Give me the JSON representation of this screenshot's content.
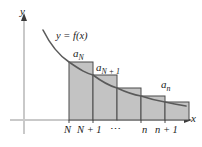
{
  "figure": {
    "colors": {
      "bar_fill": "#c3c3c3",
      "bar_stroke": "#4a4a4a",
      "curve": "#5a5a5a",
      "axis": "#c9c9c9",
      "text": "#1a1a1a",
      "background": "#ffffff"
    },
    "axes": {
      "y_label": "y",
      "x_label": "x",
      "origin": {
        "x": 24,
        "y": 120
      },
      "x_end": 196,
      "y_top": 14
    },
    "curve": {
      "label": "y = f(x)",
      "label_parts": {
        "y": "y",
        "equals": "=",
        "f": "f",
        "open": "(",
        "x": "x",
        "close": ")"
      }
    },
    "bars": [
      {
        "name": "a_N",
        "label": "a",
        "subscript": "N",
        "x": 69,
        "width": 24,
        "top": 62,
        "bottom": 120
      },
      {
        "name": "a_N1",
        "label": "a",
        "subscript": "N + 1",
        "x": 93,
        "width": 24,
        "top": 75,
        "bottom": 120
      },
      {
        "name": "bar-3",
        "label": "",
        "subscript": "",
        "x": 117,
        "width": 24,
        "top": 88,
        "bottom": 120
      },
      {
        "name": "bar-4",
        "label": "",
        "subscript": "",
        "x": 141,
        "width": 24,
        "top": 96,
        "bottom": 120
      },
      {
        "name": "a_n",
        "label": "a",
        "subscript": "n",
        "x": 165,
        "width": 24,
        "top": 102,
        "bottom": 120
      }
    ],
    "bar_labels": {
      "first": {
        "base": "a",
        "sub": "N"
      },
      "second": {
        "base": "a",
        "sub": "N + 1"
      },
      "last": {
        "base": "a",
        "sub": "n"
      }
    },
    "x_ticks": [
      {
        "name": "tick-N",
        "label": "N",
        "x": 69
      },
      {
        "name": "tick-N1",
        "label": "N + 1",
        "x": 93
      },
      {
        "name": "tick-dots",
        "label": "⋯",
        "x": 117
      },
      {
        "name": "tick-n",
        "label": "n",
        "x": 141
      },
      {
        "name": "tick-n1",
        "label": "n + 1",
        "x": 165
      }
    ]
  }
}
